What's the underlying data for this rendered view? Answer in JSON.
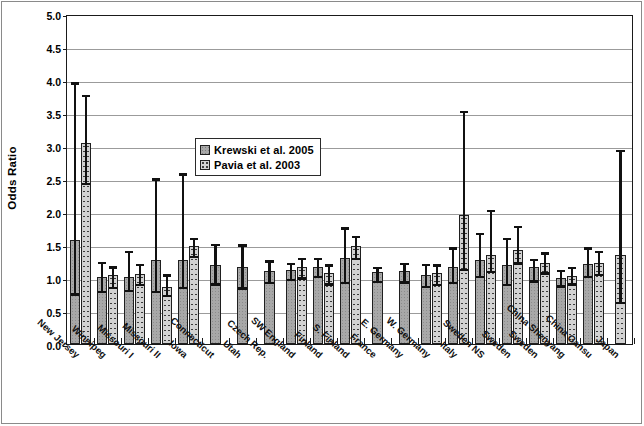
{
  "chart_data": {
    "type": "bar",
    "title": "",
    "xlabel": "",
    "ylabel": "Odds Ratio",
    "ylim": [
      0.0,
      5.0
    ],
    "ytick_labels": [
      "0.0",
      "0.5",
      "1.0",
      "1.5",
      "2.0",
      "2.5",
      "3.0",
      "3.5",
      "4.0",
      "4.5",
      "5.0"
    ],
    "ytick_values": [
      0.0,
      0.5,
      1.0,
      1.5,
      2.0,
      2.5,
      3.0,
      3.5,
      4.0,
      4.5,
      5.0
    ],
    "grid": true,
    "legend_position": "upper-center-left",
    "categories": [
      "New Jersey",
      "Winnipeg",
      "Missouri I",
      "Missouri II",
      "Iowa",
      "Connecticut",
      "Utah",
      "Czech Rep.",
      "SW England",
      "Finland",
      "S. Finland",
      "France",
      "E. Germany",
      "W. Germany",
      "Italy",
      "Sweden NS",
      "Sweden",
      "Sweden",
      "China Shenyang",
      "China Gansu",
      "Japan"
    ],
    "series": [
      {
        "name": "Krewski et al. 2005",
        "pattern": "solid-gray",
        "values": [
          1.57,
          1.02,
          1.01,
          1.28,
          1.28,
          1.2,
          1.17,
          1.11,
          1.12,
          1.16,
          1.3,
          1.09,
          1.1,
          1.05,
          1.17,
          1.28,
          1.2,
          1.17,
          1.0,
          1.21,
          null
        ],
        "ci_low": [
          0.78,
          0.82,
          0.83,
          0.82,
          0.88,
          0.93,
          0.87,
          0.95,
          1.0,
          1.05,
          0.95,
          0.97,
          0.96,
          0.89,
          0.95,
          1.05,
          0.92,
          0.98,
          0.9,
          1.05,
          null
        ],
        "ci_high": [
          3.98,
          1.26,
          1.42,
          2.52,
          2.6,
          1.53,
          1.52,
          1.28,
          1.24,
          1.32,
          1.78,
          1.18,
          1.24,
          1.23,
          1.48,
          1.7,
          1.62,
          1.3,
          1.14,
          1.48,
          null
        ]
      },
      {
        "name": "Pavia et al.  2003",
        "pattern": "dotted-gray",
        "values": [
          3.05,
          1.04,
          1.06,
          0.86,
          1.48,
          null,
          null,
          null,
          1.17,
          1.07,
          1.48,
          null,
          null,
          1.07,
          1.95,
          1.35,
          1.42,
          1.22,
          1.03,
          1.23,
          1.35
        ],
        "ci_low": [
          2.45,
          0.88,
          0.92,
          0.76,
          1.35,
          null,
          null,
          null,
          1.02,
          0.93,
          1.32,
          null,
          null,
          0.92,
          1.15,
          1.12,
          1.25,
          1.1,
          0.93,
          1.08,
          0.65
        ],
        "ci_high": [
          3.79,
          1.19,
          1.23,
          1.07,
          1.62,
          null,
          null,
          null,
          1.32,
          1.22,
          1.65,
          null,
          null,
          1.22,
          3.55,
          2.05,
          1.8,
          1.4,
          1.18,
          1.42,
          2.95
        ]
      }
    ]
  },
  "legend": {
    "items": [
      {
        "label": "Krewski et al. 2005"
      },
      {
        "label": "Pavia et al.  2003"
      }
    ]
  },
  "axis": {
    "y_title": "Odds Ratio"
  }
}
